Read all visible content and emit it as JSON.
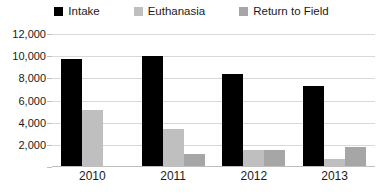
{
  "chart_data": {
    "type": "bar",
    "title": "",
    "xlabel": "",
    "ylabel": "",
    "categories": [
      "2010",
      "2011",
      "2012",
      "2013"
    ],
    "series": [
      {
        "name": "Intake",
        "color": "#000000",
        "values": [
          9750,
          10000,
          8400,
          7300
        ]
      },
      {
        "name": "Euthanasia",
        "color": "#bfbfbf",
        "values": [
          5150,
          3400,
          1500,
          700
        ]
      },
      {
        "name": "Return to Field",
        "color": "#a6a6a6",
        "values": [
          0,
          1200,
          1500,
          1800
        ]
      }
    ],
    "ylim": [
      0,
      12000
    ],
    "ytick_values": [
      12000,
      10000,
      8000,
      6000,
      4000,
      2000,
      0
    ],
    "ytick_labels": [
      "12,000",
      "10,000",
      "8,000",
      "6,000",
      "4,000",
      "2,000",
      ""
    ],
    "grid": true,
    "legend_position": "top"
  }
}
